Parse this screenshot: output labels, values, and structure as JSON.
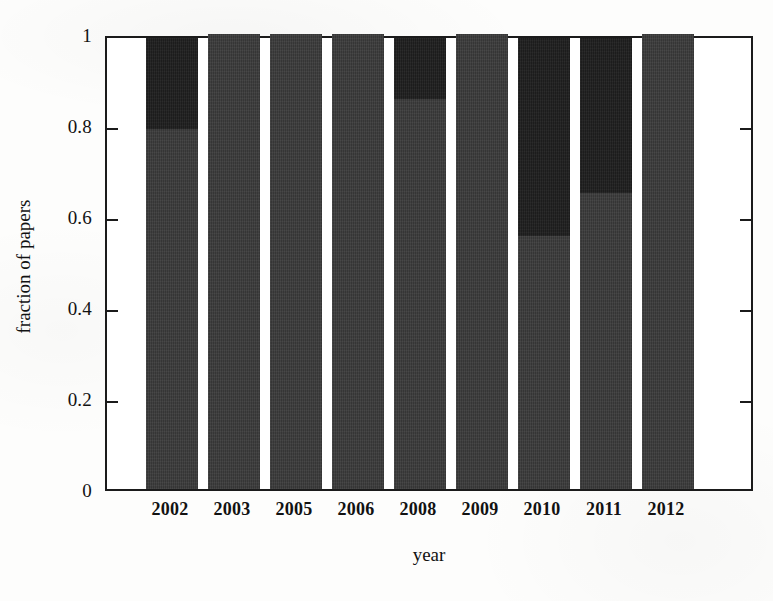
{
  "figure": {
    "background_color": "#fdfdfc",
    "frame_color": "#1b1b1b"
  },
  "chart_data": {
    "type": "bar",
    "stacked": true,
    "title": "",
    "subtitle": "",
    "xlabel": "year",
    "ylabel": "fraction of papers",
    "categories": [
      "2002",
      "2003",
      "2005",
      "2006",
      "2008",
      "2009",
      "2010",
      "2011",
      "2012"
    ],
    "ylim": [
      0,
      1
    ],
    "xlim_note": "categorical, bars left-aligned with empty space at right",
    "y_ticks": [
      0,
      0.2,
      0.4,
      0.6,
      0.8,
      1
    ],
    "y_tick_labels": [
      "0",
      "0.2",
      "0.4",
      "0.6",
      "0.8",
      "1"
    ],
    "grid": false,
    "legend": "none",
    "tick_direction": "in-out, both left and right spines",
    "series": [
      {
        "name": "lower-segment",
        "color": "#3a3a3a",
        "values": [
          0.8,
          1.0,
          1.0,
          1.0,
          0.865,
          1.0,
          0.565,
          0.66,
          1.0
        ]
      },
      {
        "name": "upper-segment",
        "color": "#1e1e1e",
        "values": [
          0.2,
          0.0,
          0.0,
          0.0,
          0.135,
          0.0,
          0.435,
          0.34,
          0.0
        ]
      }
    ],
    "bar_geometry": {
      "first_bar_left_px": 39,
      "bar_width_px": 52,
      "bar_pitch_px": 62,
      "plot_width_px": 648,
      "plot_height_px": 455
    }
  }
}
